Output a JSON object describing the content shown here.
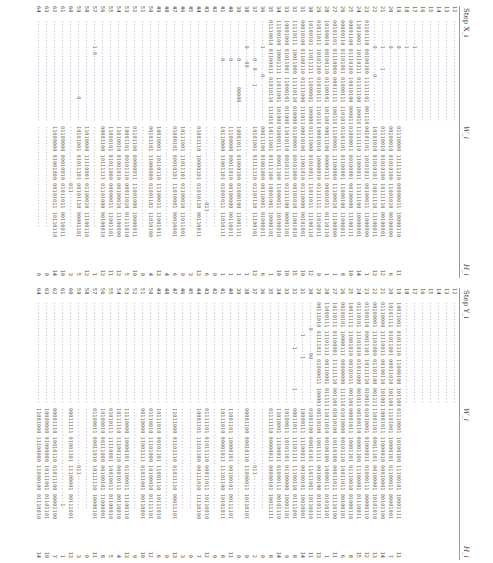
{
  "top": {
    "step_label": "Step X_i",
    "w_label": "W_i",
    "h_label": "H_i",
    "rows": [
      {
        "i": "12",
        "x": "--------------------------------",
        "w": "",
        "h": ""
      },
      {
        "i": "13",
        "x": "--------------------------------",
        "w": "",
        "h": ""
      },
      {
        "i": "14",
        "x": "--------------------------------",
        "w": "",
        "h": ""
      },
      {
        "i": "15",
        "x": "--------------------------------",
        "w": "",
        "h": ""
      },
      {
        "i": "16",
        "x": "--------------------------------",
        "w": "",
        "h": ""
      },
      {
        "i": "17",
        "x": "--------1-----------------------",
        "w": "",
        "h": ""
      },
      {
        "i": "18",
        "x": "--------1-----------------------",
        "w": "",
        "h": ""
      },
      {
        "i": "19",
        "x": "--------0-----------------------",
        "w": "01110000 11111110 00000011 10000110",
        "h": "11"
      },
      {
        "i": "20",
        "x": "--------0-----------------------",
        "w": "00100010 01010100 11001010 00100000",
        "h": "6"
      },
      {
        "i": "21",
        "x": "--------1------1----------------",
        "w": "01110010 01010100 10111110 00100001",
        "h": "12"
      },
      {
        "i": "22",
        "x": "--------0--------0--------------",
        "w": "10101010 01010101 10011110 11100011",
        "h": "13"
      },
      {
        "i": "23",
        "x": "01101110 00100100 11111101 001110",
        "w": "00101101 10101011 00100011 11000000",
        "h": "1"
      },
      {
        "i": "24",
        "x": "11010001 10110111 01111100 100010",
        "w": "11111110 11000011 11111100 10000001",
        "h": "14"
      },
      {
        "i": "25",
        "x": "00001100 01110100 10010100 00001111",
        "w": "01000011 00100001 00100000 11100111",
        "h": "10"
      },
      {
        "i": "26",
        "x": "00000110 01101001 01000111 11010111",
        "w": "01101101 01100001 11000100 11000011",
        "h": "8"
      },
      {
        "i": "27",
        "x": "00101101 01110000 00011111 10011011",
        "w": "11100001 11100000 11100010 11100000",
        "h": "1"
      },
      {
        "i": "28",
        "x": "10100010 00100110 01100101 10110011",
        "w": "00011100 00000111 00001011 01110110",
        "h": "1"
      },
      {
        "i": "29",
        "x": "01011011 10101100 01010111 11011000",
        "w": "10001010 10000010 01111111 11010011",
        "h": "9"
      },
      {
        "i": "30",
        "x": "10100101 11011111 11000001 10000011",
        "w": "01111000 01010011 11011011 11100110",
        "h": "12"
      },
      {
        "i": "31",
        "x": "00010100 01100110 01111000 11101101",
        "w": "00010100 11001010 01110000 00101001",
        "h": "10"
      },
      {
        "i": "32",
        "x": "11110111 10011000 11110110 01000001",
        "w": "01100001 00101000 00101010 11001010",
        "h": "15"
      },
      {
        "i": "33",
        "x": "10001000 01011001 11000101 01100001",
        "w": "11010110 00101111 01111100 00001101",
        "h": "10"
      },
      {
        "i": "34",
        "x": "11100100 10001111 11011001 10100010",
        "w": "01000111 00011100 11000011 10100010",
        "h": "10"
      },
      {
        "i": "35",
        "x": "01110010 01100011 01010110 11101001",
        "w": "10111001 01111100 10001001 10000101",
        "h": "1"
      },
      {
        "i": "36",
        "x": "--------1--------0--------------",
        "w": "00011100 01001000 00110001 01000011",
        "h": "6"
      },
      {
        "i": "37",
        "x": "------------0--0----1-----------",
        "w": "10101001 01111110 01101110 11100101",
        "h": "13"
      },
      {
        "i": "38",
        "x": "--------0----00-----------------",
        "w": "--------------------------------",
        "h": "1"
      },
      {
        "i": "39",
        "x": "------------0--------00000------",
        "w": "10001011 01000100 01000100 11001111",
        "h": "1"
      },
      {
        "i": "40",
        "x": "------------0-------------------",
        "w": "11100000 00011010 00100000 00110011",
        "h": "1"
      },
      {
        "i": "41",
        "x": "------------0-------------------",
        "w": "10110000 11001101 01001011 11010111",
        "h": "1"
      },
      {
        "i": "42",
        "x": "--------------------------------",
        "w": "--------------------------------",
        "h": "0"
      },
      {
        "i": "43",
        "x": "--------------------------------",
        "w": "------------------------011-----",
        "h": "6"
      },
      {
        "i": "44",
        "x": "--------------------------------",
        "w": "01001110 10000101 01010110 00110011",
        "h": "13"
      },
      {
        "i": "45",
        "x": "--------------------------------",
        "w": "--------------------------------",
        "h": "3"
      },
      {
        "i": "46",
        "x": "--------------------------------",
        "w": "10111001 11011101 01100010 11011001",
        "h": "9"
      },
      {
        "i": "47",
        "x": "--------------------------------",
        "w": "01000101 00010101 11010001 00010001",
        "h": "6"
      },
      {
        "i": "48",
        "x": "--------------------------------",
        "w": "--------------------------------",
        "h": "4"
      },
      {
        "i": "49",
        "x": "--------------------------------",
        "w": "10010001 10110110 11100011 11001011",
        "h": "13"
      },
      {
        "i": "50",
        "x": "--------------------------------",
        "w": "00101101 11000000 01001101 11010100",
        "h": "4"
      },
      {
        "i": "51",
        "x": "--------------------------------",
        "w": "--------------------------------",
        "h": "0"
      },
      {
        "i": "52",
        "x": "--------------------------------",
        "w": "01101100 00000011 11001000 10000011",
        "h": "10"
      },
      {
        "i": "53",
        "x": "--------------------------------",
        "w": "10001101 00101110 00011010 01111010",
        "h": "5"
      },
      {
        "i": "54",
        "x": "--------------------------------",
        "w": "11010010 01001010 00100010 11100000",
        "h": "13"
      },
      {
        "i": "55",
        "x": "--------------------------------",
        "w": "11000101 01011000 00000011 11001101",
        "h": "11"
      },
      {
        "i": "56",
        "x": "--------------------------------",
        "w": "00001100 10111111 01101000 00100010",
        "h": "13"
      },
      {
        "i": "57",
        "x": "--------1-0---------------------",
        "w": "--------------------------------",
        "h": "1"
      },
      {
        "i": "58",
        "x": "--------------------------------",
        "w": "11010000 11110001 01100010 11100110",
        "h": "13"
      },
      {
        "i": "59",
        "x": "------------------------0-------",
        "w": "10101001 01011101 00101110 00001101",
        "h": "5"
      },
      {
        "i": "60",
        "x": "--------------------------------",
        "w": "------------------011-----------",
        "h": "3"
      },
      {
        "i": "61",
        "x": "--------------------------------",
        "w": "01100000 00010010 01011011 00110011",
        "h": "10"
      },
      {
        "i": "62",
        "x": "--------------------------------",
        "w": "11000000 01001000 00101011 10110110",
        "h": "14"
      },
      {
        "i": "63",
        "x": "--------------------------------",
        "w": "--------------------------------",
        "h": "0"
      },
      {
        "i": "64",
        "x": "--------------------------------",
        "w": "--------------------------------",
        "h": "0"
      }
    ]
  },
  "bottom": {
    "step_label": "Step Y_i",
    "w_label": "W_i",
    "h_label": "H_i",
    "rows": [
      {
        "i": "12",
        "x": "--------------------------------",
        "w": "",
        "h": ""
      },
      {
        "i": "13",
        "x": "--------------------------------",
        "w": "",
        "h": ""
      },
      {
        "i": "14",
        "x": "--------------------------------",
        "w": "",
        "h": ""
      },
      {
        "i": "15",
        "x": "--------------------------------",
        "w": "",
        "h": ""
      },
      {
        "i": "16",
        "x": "--------------------------------",
        "w": "",
        "h": ""
      },
      {
        "i": "17",
        "x": "--------------------------------",
        "w": "",
        "h": ""
      },
      {
        "i": "18",
        "x": "--------------------------------",
        "w": "",
        "h": ""
      },
      {
        "i": "19",
        "x": "10011001 01011110 11000100 10110001",
        "w": "01110001 10100100 11100101 10001111",
        "h": "11"
      },
      {
        "i": "20",
        "x": "10101111 01011001 00011010 10110010",
        "w": "11101001 10000101 01100011 00001001",
        "h": "7"
      },
      {
        "i": "21",
        "x": "01110000 11110011 00100110 10100101",
        "w": "10001011 11000010 00010001 00101100",
        "h": "14"
      },
      {
        "i": "22",
        "x": "00100001 11101000 01101100 00111110",
        "w": "11001101 00011101 00100001 10101010",
        "h": "13"
      },
      {
        "i": "23",
        "x": "01100110 00011101 10111110 01001001",
        "w": "01010001 01000011 01000111 00000110",
        "h": "12"
      },
      {
        "i": "24",
        "x": "01110101 11101010 01011000 00101100",
        "w": "00100110 00001100 11100001 01110011",
        "h": "15"
      },
      {
        "i": "25",
        "x": "10011111 11001010 00101011 00110010",
        "w": "00001011 10001101 01110010 01000110",
        "h": "8"
      },
      {
        "i": "26",
        "x": "00100101 10000111 00000000 11111010",
        "w": "01010000 00101110 10011011 00100101",
        "h": "6"
      },
      {
        "i": "27",
        "x": "10110111 01100001 11111110 00110000",
        "w": "01010100 10110100 00011011 11110100",
        "h": "11"
      },
      {
        "i": "28",
        "x": "11000111 11101111 00110001 01111101",
        "w": "11011010 00100100 10000111 01010101",
        "h": "1"
      },
      {
        "i": "29",
        "x": "00111010 01111011 01000011 10000110",
        "w": "00110100 10011111 00100100 01101111",
        "h": "13"
      },
      {
        "i": "30",
        "x": "--------0-------00--------------",
        "w": "01001100 00010101 11011001 10110010",
        "h": "11"
      },
      {
        "i": "31",
        "x": "----------1------1--------------",
        "w": "10000111 11100011 00100101 10010001",
        "h": "14"
      },
      {
        "i": "32",
        "x": "--------------1------------1----",
        "w": "00011011 11101111 11100110 01111001",
        "h": "8"
      },
      {
        "i": "33",
        "x": "--------------------------------",
        "w": "10100011 10101101 01100000 10001101",
        "h": "9"
      },
      {
        "i": "34",
        "x": "--------------------------------",
        "w": "11010001 11100011 01000111 00101110",
        "h": "14"
      },
      {
        "i": "35",
        "x": "--------------------------------",
        "w": "01111110 00000011 00000101 10011111",
        "h": "8"
      },
      {
        "i": "36",
        "x": "--------------------------------",
        "w": "--------------------------------",
        "h": "0"
      },
      {
        "i": "37",
        "x": "--------------------------------",
        "w": "------------------011-----------",
        "h": "2"
      },
      {
        "i": "38",
        "x": "--------------------------------",
        "w": "00001100 00010110 11000011 10110101",
        "h": "9"
      },
      {
        "i": "39",
        "x": "--------------------------------",
        "w": "--------------------------------",
        "h": "0"
      },
      {
        "i": "40",
        "x": "--------------------------------",
        "w": "11001101 10000101 00100101 00111101",
        "h": "11"
      },
      {
        "i": "41",
        "x": "--------------------------------",
        "w": "10111010 00001011 11101100 10101011",
        "h": "8"
      },
      {
        "i": "42",
        "x": "--------------------------------",
        "w": "--------------------------------",
        "h": "0"
      },
      {
        "i": "43",
        "x": "--------------------------------",
        "w": "01111101 01011110 00011011 10110010",
        "h": "12"
      },
      {
        "i": "44",
        "x": "--------------------------------",
        "w": "10001101 11101100 00111010 11110100",
        "h": "7"
      },
      {
        "i": "45",
        "x": "--------------------------------",
        "w": "--------------------------------",
        "h": "0"
      },
      {
        "i": "46",
        "x": "--------------------------------",
        "w": "--------------------------------",
        "h": "3"
      },
      {
        "i": "47",
        "x": "--------------------------------",
        "w": "11011000 01101110 01011110 00011101",
        "h": "13"
      },
      {
        "i": "48",
        "x": "--------------------------------",
        "w": "--------------------------------",
        "h": "0"
      },
      {
        "i": "49",
        "x": "--------------------------------",
        "w": "10111010 00101101 11001110 10111010",
        "h": "6"
      },
      {
        "i": "50",
        "x": "--------------------------------",
        "w": "01110010 11101000 10100010 01111101",
        "h": "12"
      },
      {
        "i": "51",
        "x": "--------------------------------",
        "w": "00110000 11001111 01011001 00110001",
        "h": "10"
      },
      {
        "i": "52",
        "x": "--------------------------------",
        "w": "--------------------------------",
        "h": "0"
      },
      {
        "i": "53",
        "x": "--------------------------------",
        "w": "11110000 10000101 01100011 11100110",
        "h": "13"
      },
      {
        "i": "54",
        "x": "--------------------------------",
        "w": "10111110 11100110 00010111 00110010",
        "h": "4"
      },
      {
        "i": "55",
        "x": "--------------------------------",
        "w": "01010111 11110001 10010011 01100010",
        "h": "5"
      },
      {
        "i": "56",
        "x": "--------------------------------",
        "w": "10100010 00111000 00100101 11000001",
        "h": "8"
      },
      {
        "i": "57",
        "x": "--------------------------------",
        "w": "01100011 00011010 10111110 10000101",
        "h": "11"
      },
      {
        "i": "58",
        "x": "--------------------------------",
        "w": "--------------------------------",
        "h": "0"
      },
      {
        "i": "59",
        "x": "--------------------------------",
        "w": "------------------011-----------",
        "h": "3"
      },
      {
        "i": "60",
        "x": "--------------------------------",
        "w": "00011111 01001101 11100001 00111001",
        "h": "13"
      },
      {
        "i": "61",
        "x": "--------------------------------",
        "w": "------------------------------1-",
        "h": "1"
      },
      {
        "i": "62",
        "x": "--------------------------------",
        "w": "00001110 10010110 01011100 00001100",
        "h": "7"
      },
      {
        "i": "63",
        "x": "--------------------------------",
        "w": "10000000 01000000 10111001 01101101",
        "h": "10"
      },
      {
        "i": "64",
        "x": "--------------------------------",
        "w": "11001000 11100000 11000100 01110010",
        "h": "14"
      }
    ]
  }
}
